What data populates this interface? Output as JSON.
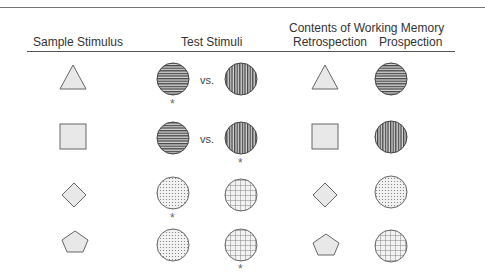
{
  "headers": {
    "sample": "Sample Stimulus",
    "test": "Test Stimuli",
    "wm_title": "Contents of Working Memory",
    "retro": "Retrospection",
    "pro": "Prospection"
  },
  "vs_label": "vs.",
  "star_label": "*",
  "colors": {
    "shape_fill": "#e8e8e8",
    "shape_stroke": "#666666",
    "line_dark": "#444444"
  },
  "rows": [
    {
      "sample": "triangle",
      "test_left": "horizontal-stripes",
      "test_right": "vertical-stripes",
      "show_vs": true,
      "correct": "left",
      "retro": "triangle",
      "pro": "horizontal-stripes"
    },
    {
      "sample": "square",
      "test_left": "horizontal-stripes",
      "test_right": "vertical-stripes",
      "show_vs": true,
      "correct": "right",
      "retro": "square",
      "pro": "vertical-stripes"
    },
    {
      "sample": "diamond",
      "test_left": "dots",
      "test_right": "grid",
      "show_vs": false,
      "correct": "left",
      "retro": "diamond",
      "pro": "dots"
    },
    {
      "sample": "pentagon",
      "test_left": "dots",
      "test_right": "grid",
      "show_vs": false,
      "correct": "right",
      "retro": "pentagon",
      "pro": "grid"
    }
  ]
}
